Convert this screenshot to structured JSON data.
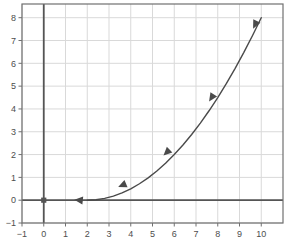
{
  "chart_data": {
    "type": "line",
    "title": "",
    "xlabel": "",
    "ylabel": "",
    "xlim": [
      -1,
      11
    ],
    "ylim": [
      -1,
      8.6
    ],
    "grid": true,
    "legend": null,
    "x_ticks": [
      -1,
      0,
      1,
      2,
      3,
      4,
      5,
      6,
      7,
      8,
      9,
      10
    ],
    "x_tick_labels": [
      "−1",
      "0",
      "1",
      "2",
      "3",
      "4",
      "5",
      "6",
      "7",
      "8",
      "9",
      "10"
    ],
    "y_ticks": [
      -1,
      0,
      1,
      2,
      3,
      4,
      5,
      6,
      7,
      8
    ],
    "y_tick_labels": [
      "−1",
      "0",
      "1",
      "2",
      "3",
      "4",
      "5",
      "6",
      "7",
      "8"
    ],
    "series": [
      {
        "name": "curve",
        "equation": "y = (x - 2)^2 / 8",
        "color": "#4a4a4a",
        "x": [
          2.0,
          2.4,
          2.8,
          3.2,
          3.6,
          4.0,
          4.4,
          4.8,
          5.2,
          5.6,
          6.0,
          6.4,
          6.8,
          7.2,
          7.6,
          8.0,
          8.4,
          8.8,
          9.2,
          9.6,
          10.0
        ],
        "values": [
          0.0,
          0.02,
          0.08,
          0.18,
          0.32,
          0.5,
          0.72,
          0.98,
          1.28,
          1.62,
          2.0,
          2.42,
          2.88,
          3.38,
          3.92,
          4.5,
          5.12,
          5.78,
          6.48,
          7.22,
          8.0
        ]
      }
    ],
    "points": [
      {
        "name": "origin-point",
        "x": 0,
        "y": 0,
        "marker": "square",
        "color": "#555555"
      }
    ],
    "direction_arrows": [
      {
        "x": 1.62,
        "y": 0.0,
        "direction": "left"
      },
      {
        "x": 3.62,
        "y": 0.66,
        "direction": "back-left"
      },
      {
        "x": 5.66,
        "y": 2.1,
        "direction": "back-left"
      },
      {
        "x": 7.72,
        "y": 4.5,
        "direction": "back-left"
      },
      {
        "x": 9.72,
        "y": 7.7,
        "direction": "back-left"
      }
    ],
    "colors": {
      "grid": "#d9d9d9",
      "axis": "#555555",
      "frame": "#707070",
      "curve": "#4a4a4a",
      "tick_text": "#4d4d4d",
      "background": "#ffffff"
    }
  }
}
